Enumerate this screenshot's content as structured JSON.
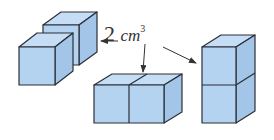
{
  "label": {
    "number": "2",
    "unit": "cm",
    "exponent": "3"
  },
  "figures": [
    {
      "id": "left",
      "description": "two unit cubes placed diagonally, one behind the other"
    },
    {
      "id": "middle",
      "description": "two unit cubes side by side horizontally"
    },
    {
      "id": "right",
      "description": "two unit cubes stacked vertically"
    }
  ],
  "colors": {
    "face_front": "#b4d3f0",
    "face_top": "#c6def5",
    "face_side": "#a3c5e8",
    "edge": "#2a2f38",
    "arrow": "#333333"
  }
}
